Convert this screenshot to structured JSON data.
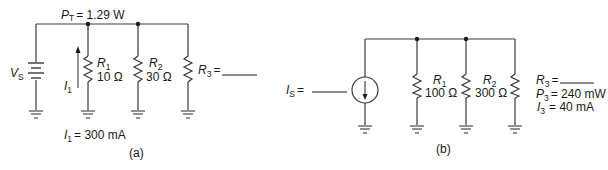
{
  "circuit_a": {
    "caption": "(a)",
    "total_power": {
      "symbol": "P",
      "sub": "T",
      "value": "= 1.29 W"
    },
    "source": {
      "symbol": "V",
      "sub": "S",
      "type": "battery"
    },
    "current_arrow": {
      "symbol": "I",
      "sub": "1"
    },
    "resistors": [
      {
        "symbol": "R",
        "sub": "1",
        "value": "10 Ω"
      },
      {
        "symbol": "R",
        "sub": "2",
        "value": "30 Ω"
      },
      {
        "symbol": "R",
        "sub": "3",
        "value": "= ______"
      }
    ],
    "given_current": {
      "symbol": "I",
      "sub": "1",
      "value": "= 300 mA"
    }
  },
  "circuit_b": {
    "caption": "(b)",
    "source": {
      "symbol": "I",
      "sub": "S",
      "value": "= ______",
      "type": "current-source"
    },
    "resistors": [
      {
        "symbol": "R",
        "sub": "1",
        "value": "100 Ω"
      },
      {
        "symbol": "R",
        "sub": "2",
        "value": "300 Ω"
      },
      {
        "symbol": "R",
        "sub": "3",
        "value": "= ______"
      }
    ],
    "r3_power": {
      "symbol": "P",
      "sub": "3",
      "value": "= 240 mW"
    },
    "r3_current": {
      "symbol": "I",
      "sub": "3",
      "value": "= 40 mA"
    }
  }
}
